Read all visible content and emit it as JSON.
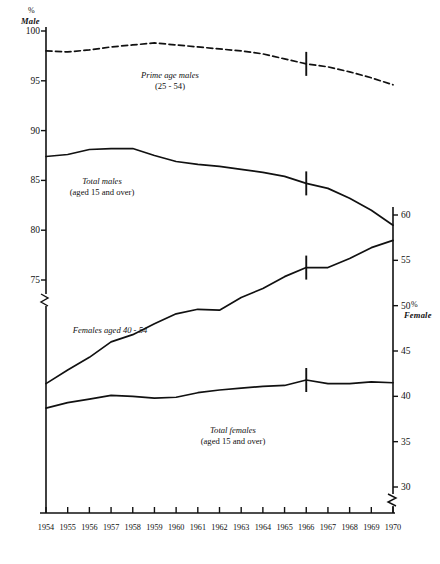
{
  "chart_data": {
    "type": "line",
    "title": "",
    "subtitle": "",
    "xlabel": "",
    "ylabel": "% Male",
    "ylabel_right": "% Female",
    "grid": false,
    "legend_position": "inline-annotations",
    "x": [
      1954,
      1955,
      1956,
      1957,
      1958,
      1959,
      1960,
      1961,
      1962,
      1963,
      1964,
      1965,
      1966,
      1967,
      1968,
      1969,
      1970
    ],
    "xtick_labels": [
      "1954",
      "1955",
      "1956",
      "1957",
      "1958",
      "1959",
      "1960",
      "1961",
      "1962",
      "1963",
      "1964",
      "1965",
      "1966",
      "1967",
      "1968",
      "1969",
      "1970"
    ],
    "xlim": [
      1954,
      1970
    ],
    "left_axis": {
      "label_pct": "%",
      "label_name": "Male",
      "ticks": [
        100,
        95,
        90,
        85,
        80,
        75
      ],
      "tick_labels": [
        "100",
        "95",
        "90",
        "85",
        "80",
        "75"
      ],
      "ylim": [
        75,
        100
      ],
      "has_break": true,
      "break_note": "axis break below 75"
    },
    "right_axis": {
      "label_pct": "%",
      "label_name": "Female",
      "ticks": [
        60,
        55,
        50,
        45,
        40,
        35,
        30
      ],
      "tick_labels": [
        "60",
        "55",
        "50",
        "45",
        "40",
        "35",
        "30"
      ],
      "ylim": [
        30,
        60
      ],
      "has_break": true,
      "break_note": "axis break below 30"
    },
    "series": [
      {
        "name": "Prime age males (25 - 54)",
        "annotation_line1": "Prime age males",
        "annotation_line2": "(25 - 54)",
        "axis": "left",
        "style": "dashed",
        "color": "#111111",
        "break_marker_year": 1966,
        "values": [
          98.0,
          97.9,
          98.1,
          98.4,
          98.6,
          98.8,
          98.6,
          98.4,
          98.2,
          98.0,
          97.7,
          97.2,
          96.7,
          96.4,
          95.9,
          95.3,
          94.6
        ]
      },
      {
        "name": "Total males (aged 15 and over)",
        "annotation_line1": "Total males",
        "annotation_line2": "(aged 15 and over)",
        "axis": "left",
        "style": "solid",
        "color": "#111111",
        "break_marker_year": 1966,
        "values": [
          87.4,
          87.6,
          88.1,
          88.2,
          88.2,
          87.5,
          86.9,
          86.6,
          86.4,
          86.1,
          85.8,
          85.4,
          84.7,
          84.2,
          83.2,
          82.0,
          80.5
        ]
      },
      {
        "name": "Females aged 40 - 54",
        "annotation_line1": "Females aged 40 - 54",
        "annotation_line2": "",
        "axis": "right",
        "style": "solid",
        "color": "#111111",
        "break_marker_year": 1966,
        "values": [
          41.4,
          42.9,
          44.3,
          46.0,
          46.8,
          48.0,
          49.1,
          49.6,
          49.5,
          50.9,
          51.9,
          53.2,
          54.2,
          54.2,
          55.2,
          56.4,
          57.2
        ]
      },
      {
        "name": "Total females (aged 15 and over)",
        "annotation_line1": "Total females",
        "annotation_line2": "(aged 15 and over)",
        "axis": "right",
        "style": "solid",
        "color": "#111111",
        "break_marker_year": 1966,
        "values": [
          38.7,
          39.3,
          39.7,
          40.1,
          40.0,
          39.8,
          39.9,
          40.4,
          40.7,
          40.9,
          41.1,
          41.2,
          41.8,
          41.4,
          41.4,
          41.6,
          41.5
        ]
      }
    ],
    "notes": [
      "Vertical tick marks at 1966 on each curve indicate a break in series definition."
    ]
  }
}
